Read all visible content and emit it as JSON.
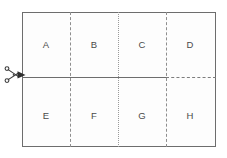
{
  "diagram": {
    "background_color": "#ffffff",
    "panel_color": "#fdfdfd",
    "border_color": "#6d6d6d",
    "divider_color": "#8e8e8e",
    "label_color": "#4a4a4a",
    "rows": 2,
    "columns": 4,
    "cells": [
      {
        "id": "cell-a",
        "label": "A",
        "row": 1,
        "column": 1
      },
      {
        "id": "cell-b",
        "label": "B",
        "row": 1,
        "column": 2
      },
      {
        "id": "cell-c",
        "label": "C",
        "row": 1,
        "column": 3
      },
      {
        "id": "cell-d",
        "label": "D",
        "row": 1,
        "column": 4
      },
      {
        "id": "cell-e",
        "label": "E",
        "row": 2,
        "column": 1
      },
      {
        "id": "cell-f",
        "label": "F",
        "row": 2,
        "column": 2
      },
      {
        "id": "cell-g",
        "label": "G",
        "row": 2,
        "column": 3
      },
      {
        "id": "cell-h",
        "label": "H",
        "row": 2,
        "column": 4
      }
    ],
    "vertical_dividers": [
      {
        "id": "divider-ab-ef",
        "style": "dashed",
        "between": "A/B and E/F"
      },
      {
        "id": "divider-bc-fg",
        "style": "dotted",
        "between": "B/C and F/G"
      },
      {
        "id": "divider-cd-gh",
        "style": "dashed",
        "between": "C/D and G/H"
      }
    ],
    "horizontal_divider": {
      "id": "cut-line",
      "solid_segment": "left edge to third vertical divider",
      "dashed_segment": "third vertical divider to right edge"
    },
    "marker": {
      "icon": "scissors-icon",
      "position": "left edge of horizontal cut line"
    }
  }
}
